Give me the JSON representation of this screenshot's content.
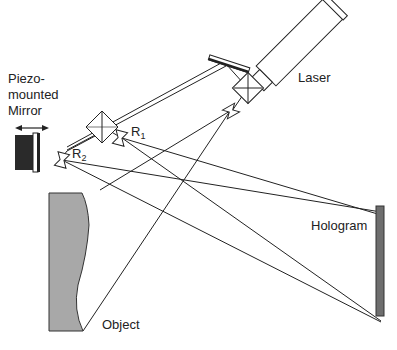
{
  "diagram": {
    "labels": {
      "laser": "Laser",
      "piezo_line1": "Piezo-",
      "piezo_line2": "mounted",
      "piezo_line3": "Mirror",
      "r1": "R",
      "r1_sub": "1",
      "r2": "R",
      "r2_sub": "2",
      "hologram": "Hologram",
      "object": "Object"
    },
    "components": [
      "Laser",
      "Beam splitter (laser)",
      "Folding mirror",
      "Beam splitter (central)",
      "Lens R1",
      "Lens R2",
      "Object-beam lens",
      "Piezo-mounted mirror",
      "Object",
      "Hologram"
    ],
    "colors": {
      "line": "#222222",
      "object_fill": "#a8a8a8",
      "hologram_fill": "#6e6e6e",
      "piezo_block": "#2a2a2a"
    }
  }
}
